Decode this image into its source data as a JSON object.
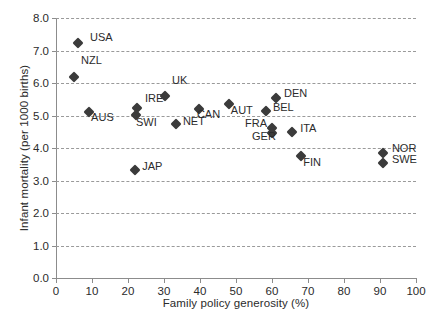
{
  "chart_data": {
    "type": "scatter",
    "title": "",
    "xlabel": "Family policy generosity (%)",
    "ylabel": "Infant mortality (per 1000 births)",
    "xlim": [
      0,
      100
    ],
    "ylim": [
      0.0,
      8.0
    ],
    "xticks": [
      "0",
      "10",
      "20",
      "30",
      "40",
      "50",
      "60",
      "70",
      "80",
      "90",
      "100"
    ],
    "yticks": [
      "0.0",
      "1.0",
      "2.0",
      "3.0",
      "4.0",
      "5.0",
      "6.0",
      "7.0",
      "8.0"
    ],
    "grid": "horizontal-dashed",
    "legend": "none",
    "marker": "diamond",
    "marker_color": "#3b3b3b",
    "grid_color": "#9a9a9a",
    "axis_color": "#8c8c8c",
    "points": [
      {
        "label": "USA",
        "x": 6.1,
        "y": 7.23,
        "lx": 12,
        "ly": -6
      },
      {
        "label": "NZL",
        "x": 5.0,
        "y": 6.2,
        "lx": 7,
        "ly": -17
      },
      {
        "label": "AUS",
        "x": 9.2,
        "y": 5.12,
        "lx": 2,
        "ly": 5
      },
      {
        "label": "SWI",
        "x": 22.2,
        "y": 5.02,
        "lx": 0,
        "ly": 7
      },
      {
        "label": "IRE",
        "x": 22.5,
        "y": 5.22,
        "lx": 8,
        "ly": -10
      },
      {
        "label": "UK",
        "x": 30.3,
        "y": 5.6,
        "lx": 7,
        "ly": -16
      },
      {
        "label": "JAP",
        "x": 22.0,
        "y": 3.32,
        "lx": 7,
        "ly": -4
      },
      {
        "label": "NET",
        "x": 33.3,
        "y": 4.73,
        "lx": 7,
        "ly": -3
      },
      {
        "label": "CAN",
        "x": 39.7,
        "y": 5.21,
        "lx": -2,
        "ly": 5
      },
      {
        "label": "AUT",
        "x": 48.0,
        "y": 5.35,
        "lx": 2,
        "ly": 6
      },
      {
        "label": "BEL",
        "x": 58.3,
        "y": 5.13,
        "lx": 7,
        "ly": -4
      },
      {
        "label": "DEN",
        "x": 61.1,
        "y": 5.53,
        "lx": 8,
        "ly": -5
      },
      {
        "label": "FRA",
        "x": 60.0,
        "y": 4.62,
        "lx": -27,
        "ly": -5
      },
      {
        "label": "GER",
        "x": 60.0,
        "y": 4.45,
        "lx": -20,
        "ly": 3
      },
      {
        "label": "ITA",
        "x": 65.6,
        "y": 4.48,
        "lx": 8,
        "ly": -4
      },
      {
        "label": "FIN",
        "x": 68.1,
        "y": 3.75,
        "lx": 2,
        "ly": 6
      },
      {
        "label": "NOR",
        "x": 90.8,
        "y": 3.85,
        "lx": 9,
        "ly": -5
      },
      {
        "label": "SWE",
        "x": 90.8,
        "y": 3.55,
        "lx": 9,
        "ly": -4
      }
    ]
  }
}
